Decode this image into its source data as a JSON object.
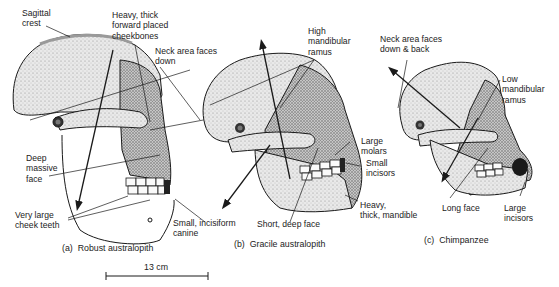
{
  "figure": {
    "panels": [
      {
        "id": "a",
        "caption": "(a)  Robust australopith",
        "labels": {
          "sagittal_crest": "Sagittal\ncrest",
          "cheekbones": "Heavy, thick\nforward placed\ncheekbones",
          "neck": "Neck area faces\ndown",
          "face": "Deep\nmassive\nface",
          "cheek_teeth": "Very large\ncheek teeth",
          "canine": "Small, incisiform\ncanine"
        }
      },
      {
        "id": "b",
        "caption": "(b)  Gracile australopith",
        "labels": {
          "ramus": "High\nmandibular\nramus",
          "molars": "Large\nmolars",
          "incisors": "Small\nincisors",
          "mandible": "Heavy,\nthick, mandible",
          "face": "Short, deep face"
        }
      },
      {
        "id": "c",
        "caption": "(c)  Chimpanzee",
        "labels": {
          "neck": "Neck area faces\ndown & back",
          "ramus": "Low\nmandibular\nramus",
          "face": "Long face",
          "incisors": "Large\nincisors"
        }
      }
    ],
    "scale_bar": {
      "label": "13 cm"
    },
    "colors": {
      "ink": "#1a1a1a",
      "bone": "#e6e6e6",
      "shade": "#b5b5b5",
      "background": "#ffffff"
    }
  }
}
